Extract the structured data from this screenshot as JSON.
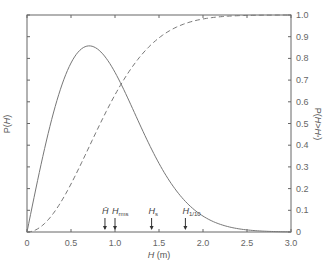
{
  "chart_data": {
    "type": "line",
    "title": "",
    "xlabel": "H (m)",
    "ylabel_left": "P(H)",
    "ylabel_right": "P(H>H*)",
    "xlim": [
      0,
      3.0
    ],
    "ylim_left": [
      0,
      1.0
    ],
    "ylim_right": [
      0,
      1.0
    ],
    "x_ticks": [
      "0",
      "0.5",
      "1.0",
      "1.5",
      "2.0",
      "2.5",
      "3.0"
    ],
    "y_ticks_right": [
      "0",
      "0.1",
      "0.2",
      "0.3",
      "0.4",
      "0.5",
      "0.6",
      "0.7",
      "0.8",
      "0.9",
      "1.0"
    ],
    "grid": false,
    "legend": null,
    "x": [
      0,
      0.1,
      0.2,
      0.3,
      0.4,
      0.5,
      0.6,
      0.7,
      0.8,
      0.9,
      1.0,
      1.1,
      1.2,
      1.3,
      1.4,
      1.5,
      1.6,
      1.7,
      1.8,
      1.9,
      2.0,
      2.2,
      2.4,
      2.6,
      2.8,
      3.0
    ],
    "series": [
      {
        "name": "P(H)",
        "style": "solid",
        "axis": "left",
        "values": [
          0,
          0.198,
          0.384,
          0.548,
          0.682,
          0.779,
          0.837,
          0.857,
          0.843,
          0.802,
          0.736,
          0.655,
          0.568,
          0.479,
          0.394,
          0.316,
          0.247,
          0.189,
          0.141,
          0.102,
          0.073,
          0.035,
          0.015,
          0.006,
          0.002,
          0.001
        ]
      },
      {
        "name": "P(H>H*)",
        "style": "dashed",
        "axis": "right",
        "values": [
          0,
          0.01,
          0.039,
          0.086,
          0.148,
          0.221,
          0.302,
          0.387,
          0.473,
          0.555,
          0.632,
          0.702,
          0.763,
          0.815,
          0.859,
          0.895,
          0.923,
          0.944,
          0.961,
          0.973,
          0.982,
          0.992,
          0.997,
          0.999,
          1.0,
          1.0
        ]
      }
    ],
    "annotations": [
      {
        "label": "H̄",
        "sub": "",
        "x": 0.886
      },
      {
        "label": "H",
        "sub": "rms",
        "x": 1.0
      },
      {
        "label": "H",
        "sub": "s",
        "x": 1.416
      },
      {
        "label": "H",
        "sub": "1/10",
        "x": 1.8
      }
    ]
  }
}
